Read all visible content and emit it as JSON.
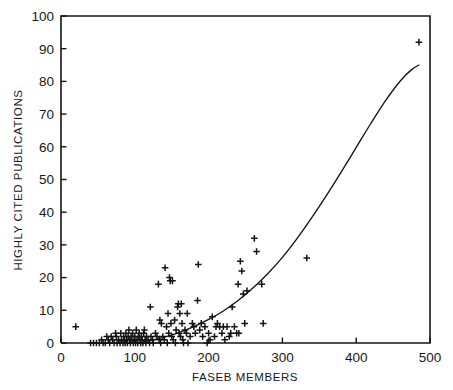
{
  "chart_data": {
    "type": "scatter",
    "title": "",
    "xlabel": "FASEB MEMBERS",
    "ylabel": "HIGHLY CITED PUBLICATIONS",
    "xlim": [
      0,
      500
    ],
    "ylim": [
      0,
      100
    ],
    "xticks": [
      0,
      100,
      200,
      300,
      400,
      500
    ],
    "yticks": [
      0,
      10,
      20,
      30,
      40,
      50,
      60,
      70,
      80,
      90,
      100
    ],
    "xtick_labels": [
      "0",
      "100",
      "200",
      "300",
      "400",
      "500"
    ],
    "ytick_labels": [
      "0",
      "10",
      "20",
      "30",
      "40",
      "50",
      "60",
      "70",
      "80",
      "90",
      "100"
    ],
    "grid": false,
    "legend": null,
    "marker": "plus",
    "marker_color": "#141414",
    "frame_color": "#141414",
    "series": [
      {
        "name": "institutions",
        "marker": "plus",
        "points": [
          [
            20,
            5
          ],
          [
            40,
            0
          ],
          [
            44,
            0
          ],
          [
            48,
            0
          ],
          [
            52,
            0
          ],
          [
            55,
            1
          ],
          [
            57,
            0
          ],
          [
            60,
            0
          ],
          [
            62,
            2
          ],
          [
            64,
            1
          ],
          [
            66,
            0
          ],
          [
            68,
            2
          ],
          [
            70,
            1
          ],
          [
            72,
            0
          ],
          [
            74,
            3
          ],
          [
            75,
            2
          ],
          [
            76,
            0
          ],
          [
            78,
            1
          ],
          [
            80,
            0
          ],
          [
            81,
            3
          ],
          [
            82,
            1
          ],
          [
            84,
            0
          ],
          [
            85,
            2
          ],
          [
            86,
            1
          ],
          [
            87,
            0
          ],
          [
            88,
            3
          ],
          [
            89,
            1
          ],
          [
            90,
            0
          ],
          [
            91,
            2
          ],
          [
            92,
            4
          ],
          [
            93,
            1
          ],
          [
            94,
            0
          ],
          [
            95,
            2
          ],
          [
            96,
            1
          ],
          [
            97,
            3
          ],
          [
            98,
            0
          ],
          [
            99,
            1
          ],
          [
            100,
            2
          ],
          [
            101,
            0
          ],
          [
            102,
            4
          ],
          [
            103,
            1
          ],
          [
            104,
            0
          ],
          [
            105,
            2
          ],
          [
            106,
            3
          ],
          [
            107,
            1
          ],
          [
            108,
            0
          ],
          [
            109,
            2
          ],
          [
            110,
            1
          ],
          [
            111,
            0
          ],
          [
            112,
            3
          ],
          [
            113,
            4
          ],
          [
            114,
            1
          ],
          [
            115,
            0
          ],
          [
            116,
            2
          ],
          [
            118,
            1
          ],
          [
            120,
            0
          ],
          [
            121,
            11
          ],
          [
            122,
            2
          ],
          [
            124,
            1
          ],
          [
            125,
            0
          ],
          [
            128,
            3
          ],
          [
            130,
            2
          ],
          [
            132,
            18
          ],
          [
            133,
            1
          ],
          [
            134,
            7
          ],
          [
            135,
            0
          ],
          [
            136,
            6
          ],
          [
            138,
            2
          ],
          [
            140,
            1
          ],
          [
            141,
            23
          ],
          [
            143,
            5
          ],
          [
            144,
            0
          ],
          [
            145,
            9
          ],
          [
            146,
            3
          ],
          [
            147,
            20
          ],
          [
            148,
            19
          ],
          [
            149,
            6
          ],
          [
            150,
            2
          ],
          [
            151,
            19
          ],
          [
            152,
            1
          ],
          [
            154,
            7
          ],
          [
            155,
            0
          ],
          [
            156,
            4
          ],
          [
            158,
            11
          ],
          [
            159,
            12
          ],
          [
            160,
            3
          ],
          [
            161,
            9
          ],
          [
            162,
            2
          ],
          [
            163,
            12
          ],
          [
            164,
            6
          ],
          [
            165,
            1
          ],
          [
            166,
            0
          ],
          [
            168,
            4
          ],
          [
            170,
            3
          ],
          [
            171,
            9
          ],
          [
            172,
            0
          ],
          [
            175,
            2
          ],
          [
            178,
            6
          ],
          [
            180,
            5
          ],
          [
            182,
            3
          ],
          [
            185,
            13
          ],
          [
            186,
            24
          ],
          [
            188,
            4
          ],
          [
            190,
            6
          ],
          [
            192,
            2
          ],
          [
            195,
            5
          ],
          [
            198,
            0
          ],
          [
            200,
            3
          ],
          [
            202,
            1
          ],
          [
            205,
            8
          ],
          [
            208,
            2
          ],
          [
            210,
            5
          ],
          [
            212,
            6
          ],
          [
            215,
            5
          ],
          [
            218,
            3
          ],
          [
            220,
            5
          ],
          [
            222,
            1
          ],
          [
            225,
            5
          ],
          [
            228,
            2
          ],
          [
            230,
            3
          ],
          [
            232,
            11
          ],
          [
            235,
            5
          ],
          [
            238,
            3
          ],
          [
            240,
            18
          ],
          [
            241,
            3
          ],
          [
            243,
            25
          ],
          [
            245,
            22
          ],
          [
            247,
            15
          ],
          [
            249,
            6
          ],
          [
            252,
            16
          ],
          [
            262,
            32
          ],
          [
            265,
            28
          ],
          [
            272,
            18
          ],
          [
            274,
            6
          ],
          [
            333,
            26
          ],
          [
            485,
            92
          ]
        ]
      }
    ],
    "fit_curve": {
      "name": "fitted regression curve",
      "style": "solid",
      "color": "#141414",
      "points": [
        [
          105,
          0.0
        ],
        [
          120,
          0.7
        ],
        [
          140,
          1.8
        ],
        [
          160,
          3.2
        ],
        [
          180,
          5.0
        ],
        [
          200,
          7.2
        ],
        [
          220,
          9.8
        ],
        [
          240,
          13.0
        ],
        [
          260,
          16.8
        ],
        [
          280,
          21.2
        ],
        [
          300,
          26.2
        ],
        [
          320,
          32.0
        ],
        [
          340,
          38.4
        ],
        [
          360,
          45.2
        ],
        [
          380,
          52.4
        ],
        [
          400,
          59.8
        ],
        [
          420,
          67.2
        ],
        [
          440,
          74.2
        ],
        [
          460,
          80.2
        ],
        [
          475,
          83.6
        ],
        [
          485,
          85.0
        ]
      ]
    }
  }
}
